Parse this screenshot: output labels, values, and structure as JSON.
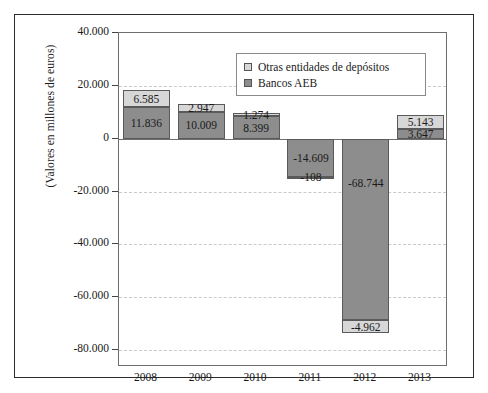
{
  "chart_data": {
    "type": "bar",
    "stacked": true,
    "title": "",
    "xlabel": "",
    "ylabel": "(Valores en millones de euros)",
    "categories": [
      "2008",
      "2009",
      "2010",
      "2011",
      "2012",
      "2013"
    ],
    "ylim": [
      -80000,
      40000
    ],
    "ytick_values": [
      40000,
      20000,
      0,
      -20000,
      -40000,
      -60000,
      -80000
    ],
    "ytick_labels": [
      "40.000",
      "20.000",
      "0",
      "-20.000",
      "-40.000",
      "-60.000",
      "-80.000"
    ],
    "grid": true,
    "legend_position": "top-center-inside",
    "series": [
      {
        "name": "Otras entidades de depósitos",
        "color": "#d7d7d7",
        "values": [
          6585,
          2947,
          1274,
          -108,
          -4962,
          5143
        ],
        "labels": [
          "6.585",
          "2.947",
          "1.274",
          "-108",
          "-4.962",
          "5.143"
        ]
      },
      {
        "name": "Bancos AEB",
        "color": "#8d8d8d",
        "values": [
          11836,
          10009,
          8399,
          -14609,
          -68744,
          3647
        ],
        "labels": [
          "11.836",
          "10.009",
          "8.399",
          "-14.609",
          "-68.744",
          "3.647"
        ]
      }
    ]
  },
  "legend": {
    "items": [
      {
        "label": "Otras entidades de depósitos",
        "color": "#d7d7d7"
      },
      {
        "label": "Bancos AEB",
        "color": "#8d8d8d"
      }
    ]
  }
}
